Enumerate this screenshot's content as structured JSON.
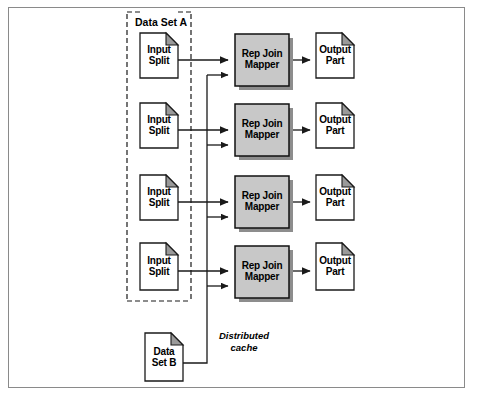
{
  "diagram": {
    "type": "flow-diagram",
    "canvas": {
      "width": 479,
      "height": 401
    },
    "frame": {
      "stroke": "#8a8a8a"
    },
    "colors": {
      "page_fill": "#ffffff",
      "page_stroke": "#1a1a1a",
      "fold_fill": "#9a9a9a",
      "mapper_fill": "#c8c8c8",
      "mapper_stroke": "#111111",
      "shadow": "#8d8d8d",
      "arrow": "#1a1a1a",
      "dashed_stroke": "#1a1a1a"
    },
    "group": {
      "label": "Data Set A",
      "style": "dashed-bracket"
    },
    "rows": [
      {
        "input": {
          "line1": "Input",
          "line2": "Split"
        },
        "mapper": {
          "line1": "Rep Join",
          "line2": "Mapper"
        },
        "output": {
          "line1": "Output",
          "line2": "Part"
        }
      },
      {
        "input": {
          "line1": "Input",
          "line2": "Split"
        },
        "mapper": {
          "line1": "Rep Join",
          "line2": "Mapper"
        },
        "output": {
          "line1": "Output",
          "line2": "Part"
        }
      },
      {
        "input": {
          "line1": "Input",
          "line2": "Split"
        },
        "mapper": {
          "line1": "Rep Join",
          "line2": "Mapper"
        },
        "output": {
          "line1": "Output",
          "line2": "Part"
        }
      },
      {
        "input": {
          "line1": "Input",
          "line2": "Split"
        },
        "mapper": {
          "line1": "Rep Join",
          "line2": "Mapper"
        },
        "output": {
          "line1": "Output",
          "line2": "Part"
        }
      }
    ],
    "cache_source": {
      "line1": "Data",
      "line2": "Set B"
    },
    "cache_edge": {
      "line1": "Distributed",
      "line2": "cache"
    }
  }
}
